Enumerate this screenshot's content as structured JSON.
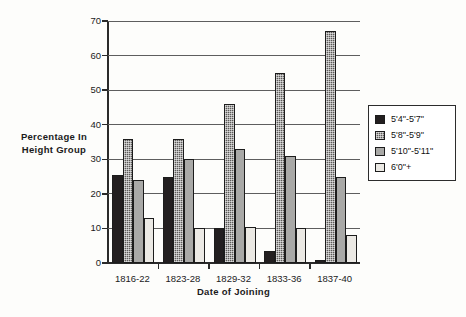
{
  "chart_data": {
    "type": "bar",
    "title": "",
    "xlabel": "Date of Joining",
    "ylabel": "Percentage In Height Group",
    "ylabel_lines": [
      "Percentage  In",
      "Height Group"
    ],
    "categories": [
      "1816-22",
      "1823-28",
      "1829-32",
      "1833-36",
      "1837-40"
    ],
    "yticks": [
      0,
      10,
      20,
      30,
      40,
      50,
      60,
      70
    ],
    "ytick_labels": [
      "0",
      "10",
      "20",
      "30",
      "40",
      "50",
      "60",
      "70"
    ],
    "ylim": [
      0,
      70
    ],
    "grid": true,
    "legend_position": "right",
    "series": [
      {
        "name": "5'4\"-5'7\"",
        "color": "#231f20",
        "values": [
          25.5,
          25,
          10,
          3.5,
          1
        ]
      },
      {
        "name": "5'8\"-5'9\"",
        "color": "#5c5a58",
        "values": [
          36,
          36,
          46,
          55,
          67
        ]
      },
      {
        "name": "5'10\"-5'11\"",
        "color": "#a9a9a7",
        "values": [
          24,
          30,
          33,
          31,
          25
        ]
      },
      {
        "name": "6'0\"+",
        "color": "#ebe9e4",
        "values": [
          13,
          10,
          10.5,
          10,
          8
        ]
      }
    ]
  }
}
